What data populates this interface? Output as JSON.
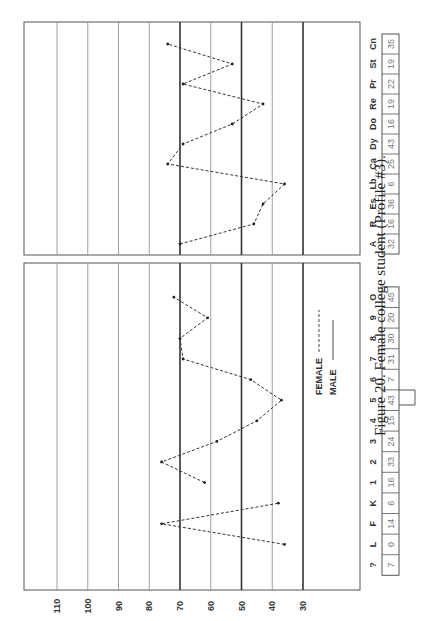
{
  "chart_data": {
    "type": "line",
    "orientation": "rotated-90-ccw",
    "title": "Figure 20. Female college student (Profile #3).",
    "ylabel": "T-score",
    "ylim": [
      30,
      110
    ],
    "yticks": [
      110,
      100,
      90,
      80,
      70,
      60,
      50,
      40,
      30
    ],
    "heavy_gridlines": [
      70,
      50,
      30
    ],
    "legend": {
      "position": "center-right",
      "entries": [
        {
          "label": "FEMALE",
          "style": "dashed"
        },
        {
          "label": "MALE",
          "style": "solid"
        }
      ]
    },
    "panels": [
      {
        "name": "basic-scales",
        "categories": [
          "?",
          "L",
          "F",
          "K",
          "1",
          "2",
          "3",
          "4",
          "5",
          "6",
          "7",
          "8",
          "9",
          "O"
        ],
        "raw_scores": [
          "7",
          "0",
          "14",
          "6",
          "16",
          "33",
          "24",
          "15",
          "43",
          "7",
          "31",
          "30",
          "20",
          "45"
        ],
        "segments": [
          {
            "series": "FEMALE",
            "categories": [
              "L",
              "F",
              "K"
            ],
            "values": [
              36,
              76,
              38
            ]
          },
          {
            "series": "FEMALE",
            "categories": [
              "1",
              "2",
              "3",
              "4",
              "5",
              "6",
              "7",
              "8",
              "9",
              "O"
            ],
            "values": [
              62,
              76,
              58,
              45,
              37,
              47,
              69,
              70,
              61,
              72
            ]
          }
        ]
      },
      {
        "name": "supplementary-scales",
        "categories": [
          "A",
          "R",
          "Es",
          "Lb",
          "Ca",
          "Dy",
          "Do",
          "Re",
          "Pr",
          "St",
          "Cn"
        ],
        "raw_scores": [
          "32",
          "16",
          "36",
          "6",
          "25",
          "43",
          "16",
          "19",
          "22",
          "19",
          "35"
        ],
        "segments": [
          {
            "series": "FEMALE",
            "categories": [
              "A",
              "R",
              "Es",
              "Lb",
              "Ca",
              "Dy",
              "Do",
              "Re",
              "Pr",
              "St",
              "Cn"
            ],
            "values": [
              70,
              46,
              43,
              36,
              74,
              69,
              53,
              43,
              69,
              53,
              74
            ]
          }
        ]
      }
    ]
  }
}
